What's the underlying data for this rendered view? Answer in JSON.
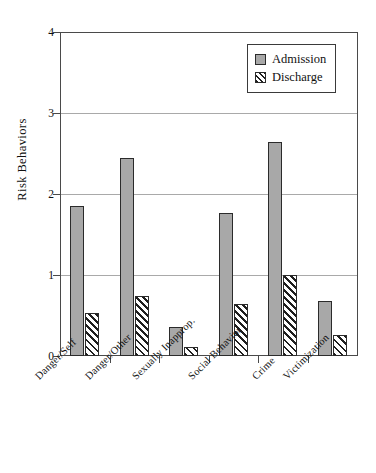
{
  "chart_data": {
    "type": "bar",
    "title": "",
    "xlabel": "",
    "ylabel": "Risk Behaviors",
    "ylim": [
      0,
      4
    ],
    "yticks": [
      "0",
      "1",
      "2",
      "3",
      "4"
    ],
    "grid": true,
    "legend_position": "top-right",
    "categories": [
      "Danger/Self",
      "Danger/Other",
      "Sexually Inapprop.",
      "Social Behavior",
      "Crime",
      "Victimization"
    ],
    "series": [
      {
        "name": "Admission",
        "color": "#a8a8a8",
        "values": [
          1.85,
          2.44,
          0.36,
          1.76,
          2.64,
          0.68
        ]
      },
      {
        "name": "Discharge",
        "color": "#ffffff",
        "values": [
          0.53,
          0.74,
          0.11,
          0.64,
          1.0,
          0.26
        ]
      }
    ]
  },
  "legend": {
    "items": [
      {
        "label": "Admission",
        "swatch": "solid-gray-swatch"
      },
      {
        "label": "Discharge",
        "swatch": "hatched-swatch"
      }
    ]
  },
  "axes": {
    "y_title": "Risk Behaviors",
    "y_ticks": [
      "4",
      "3",
      "2",
      "1",
      "0"
    ],
    "x_categories": [
      "Danger/Self",
      "Danger/Other",
      "Sexually Inapprop.",
      "Social Behavior",
      "Crime",
      "Victimization"
    ]
  }
}
